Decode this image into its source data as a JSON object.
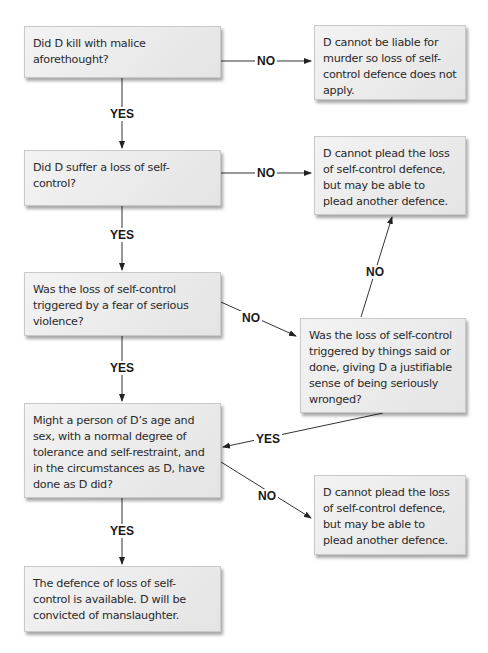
{
  "flowchart": {
    "questions": [
      {
        "id": "q1",
        "text": "Did D kill with malice aforethought?"
      },
      {
        "id": "q2",
        "text": "Did D suffer a loss of self-control?"
      },
      {
        "id": "q3",
        "text": "Was the loss of self-control triggered by a fear of serious violence?"
      },
      {
        "id": "q4",
        "text": "Was the loss of self-control triggered by things said or done, giving D a justifiable sense of being seriously wronged?"
      },
      {
        "id": "q5",
        "text": "Might a person of D’s age and sex, with a normal degree of tolerance and self-restraint, and in the circumstances as D, have done as D did?"
      }
    ],
    "results": [
      {
        "id": "r1",
        "text": "D cannot be liable for murder so loss of self-control defence does not apply."
      },
      {
        "id": "r2",
        "text": "D cannot plead the loss of self-control defence, but may be able to plead another defence."
      },
      {
        "id": "r3",
        "text": "D cannot plead the loss of self-control defence, but may be able to plead another defence."
      },
      {
        "id": "r4",
        "text": "The defence of loss of self-control is available. D will be convicted of manslaughter."
      }
    ],
    "edges": [
      {
        "from": "q1",
        "to": "r1",
        "label": "NO"
      },
      {
        "from": "q1",
        "to": "q2",
        "label": "YES"
      },
      {
        "from": "q2",
        "to": "r2",
        "label": "NO"
      },
      {
        "from": "q2",
        "to": "q3",
        "label": "YES"
      },
      {
        "from": "q3",
        "to": "q4",
        "label": "NO"
      },
      {
        "from": "q3",
        "to": "q5",
        "label": "YES"
      },
      {
        "from": "q4",
        "to": "r2",
        "label": "NO"
      },
      {
        "from": "q4",
        "to": "q5",
        "label": "YES"
      },
      {
        "from": "q5",
        "to": "r3",
        "label": "NO"
      },
      {
        "from": "q5",
        "to": "r4",
        "label": "YES"
      }
    ]
  }
}
